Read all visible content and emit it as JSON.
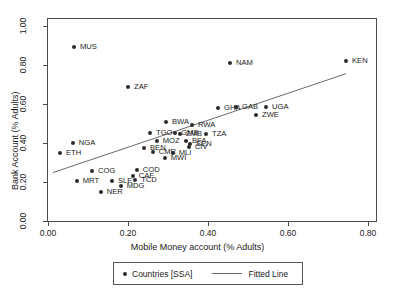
{
  "chart_data": {
    "type": "scatter",
    "title": "",
    "xlabel": "Mobile Money account (% Adults)",
    "ylabel": "Bank Account (% Adults)",
    "xlim": [
      0.0,
      0.82
    ],
    "ylim": [
      0.0,
      1.02
    ],
    "xticks": [
      "0.00",
      "0.20",
      "0.40",
      "0.60",
      "0.80"
    ],
    "xtick_values": [
      0.0,
      0.2,
      0.4,
      0.6,
      0.8
    ],
    "yticks": [
      "0.00",
      "0.20",
      "0.40",
      "0.60",
      "0.80",
      "1.00"
    ],
    "ytick_values": [
      0.0,
      0.2,
      0.4,
      0.6,
      0.8,
      1.0
    ],
    "grid": false,
    "legend_position": "below-axis",
    "series": [
      {
        "name": "Countries [SSA]",
        "marker": "filled-circle",
        "color": "#2b2b2b",
        "points": [
          {
            "label": "MUS",
            "x": 0.065,
            "y": 0.89,
            "lx": 6,
            "ly": -4
          },
          {
            "label": "ZAF",
            "x": 0.2,
            "y": 0.685,
            "lx": 6,
            "ly": -4
          },
          {
            "label": "NAM",
            "x": 0.455,
            "y": 0.81,
            "lx": 6,
            "ly": -4
          },
          {
            "label": "KEN",
            "x": 0.745,
            "y": 0.82,
            "lx": 6,
            "ly": -4
          },
          {
            "label": "BWA",
            "x": 0.295,
            "y": 0.505,
            "lx": 6,
            "ly": -4
          },
          {
            "label": "RWA",
            "x": 0.36,
            "y": 0.49,
            "lx": 6,
            "ly": -4
          },
          {
            "label": "GHA",
            "x": 0.425,
            "y": 0.58,
            "lx": 6,
            "ly": -4
          },
          {
            "label": "GAB",
            "x": 0.47,
            "y": 0.585,
            "lx": 6,
            "ly": -4
          },
          {
            "label": "UGA",
            "x": 0.545,
            "y": 0.585,
            "lx": 6,
            "ly": -4
          },
          {
            "label": "ZWE",
            "x": 0.52,
            "y": 0.545,
            "lx": 6,
            "ly": -4
          },
          {
            "label": "TZA",
            "x": 0.395,
            "y": 0.445,
            "lx": 6,
            "ly": -4
          },
          {
            "label": "TGO",
            "x": 0.255,
            "y": 0.45,
            "lx": 6,
            "ly": -4
          },
          {
            "label": "GMB",
            "x": 0.318,
            "y": 0.45,
            "lx": 6,
            "ly": -4
          },
          {
            "label": "ZMB",
            "x": 0.33,
            "y": 0.448,
            "lx": 6,
            "ly": -4
          },
          {
            "label": "MOZ",
            "x": 0.272,
            "y": 0.41,
            "lx": 6,
            "ly": -4
          },
          {
            "label": "BFA",
            "x": 0.345,
            "y": 0.408,
            "lx": 6,
            "ly": -4
          },
          {
            "label": "SEN",
            "x": 0.355,
            "y": 0.395,
            "lx": 6,
            "ly": -4
          },
          {
            "label": "CIV",
            "x": 0.352,
            "y": 0.378,
            "lx": 6,
            "ly": -4
          },
          {
            "label": "BEN",
            "x": 0.24,
            "y": 0.375,
            "lx": 6,
            "ly": -4
          },
          {
            "label": "CMR",
            "x": 0.262,
            "y": 0.352,
            "lx": 6,
            "ly": -4
          },
          {
            "label": "MLI",
            "x": 0.312,
            "y": 0.348,
            "lx": 6,
            "ly": -4
          },
          {
            "label": "MWI",
            "x": 0.292,
            "y": 0.325,
            "lx": 6,
            "ly": -4
          },
          {
            "label": "NGA",
            "x": 0.062,
            "y": 0.4,
            "lx": 6,
            "ly": -4
          },
          {
            "label": "ETH",
            "x": 0.03,
            "y": 0.35,
            "lx": 6,
            "ly": -4
          },
          {
            "label": "COG",
            "x": 0.11,
            "y": 0.255,
            "lx": 6,
            "ly": -4
          },
          {
            "label": "COD",
            "x": 0.222,
            "y": 0.262,
            "lx": 6,
            "ly": -4
          },
          {
            "label": "CAF",
            "x": 0.212,
            "y": 0.232,
            "lx": 6,
            "ly": -4
          },
          {
            "label": "TCD",
            "x": 0.218,
            "y": 0.212,
            "lx": 6,
            "ly": -4
          },
          {
            "label": "MRT",
            "x": 0.072,
            "y": 0.205,
            "lx": 6,
            "ly": -4
          },
          {
            "label": "SLE",
            "x": 0.16,
            "y": 0.205,
            "lx": 6,
            "ly": -4
          },
          {
            "label": "MDG",
            "x": 0.182,
            "y": 0.178,
            "lx": 6,
            "ly": -4
          },
          {
            "label": "NER",
            "x": 0.132,
            "y": 0.15,
            "lx": 6,
            "ly": -4
          }
        ]
      }
    ],
    "fitted_line": {
      "name": "Fitted Line",
      "color": "#6a6a6a",
      "x0": 0.012,
      "y0": 0.248,
      "x1": 0.745,
      "y1": 0.755
    }
  },
  "legend": {
    "scatter_label": "Countries [SSA]",
    "line_label": "Fitted Line"
  }
}
